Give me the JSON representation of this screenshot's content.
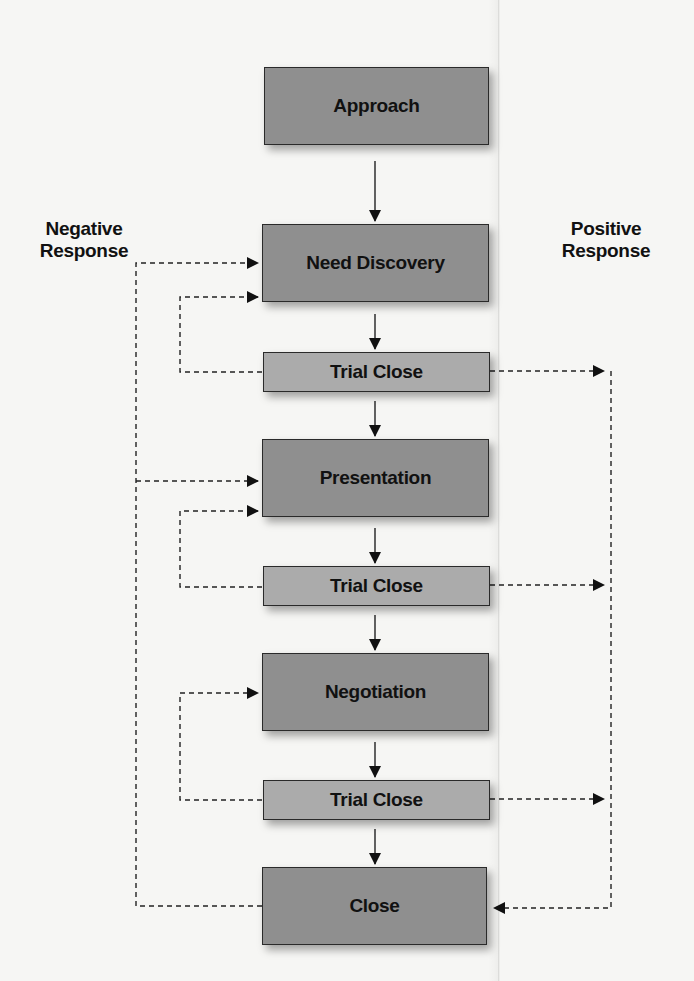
{
  "diagram": {
    "type": "flowchart",
    "labels": {
      "negative": [
        "Negative",
        "Response"
      ],
      "positive": [
        "Positive",
        "Response"
      ]
    },
    "steps": [
      {
        "id": "approach",
        "label": "Approach",
        "kind": "major"
      },
      {
        "id": "need_discovery",
        "label": "Need Discovery",
        "kind": "major"
      },
      {
        "id": "trial_close_1",
        "label": "Trial Close",
        "kind": "trial"
      },
      {
        "id": "presentation",
        "label": "Presentation",
        "kind": "major"
      },
      {
        "id": "trial_close_2",
        "label": "Trial Close",
        "kind": "trial"
      },
      {
        "id": "negotiation",
        "label": "Negotiation",
        "kind": "major"
      },
      {
        "id": "trial_close_3",
        "label": "Trial Close",
        "kind": "trial"
      },
      {
        "id": "close",
        "label": "Close",
        "kind": "major"
      }
    ],
    "main_flow": [
      "approach",
      "need_discovery",
      "trial_close_1",
      "presentation",
      "trial_close_2",
      "negotiation",
      "trial_close_3",
      "close"
    ],
    "negative_response_edges": [
      {
        "from": "close",
        "to": "need_discovery",
        "style": "dashed"
      },
      {
        "from": "close",
        "to": "presentation",
        "style": "dashed"
      },
      {
        "from": "trial_close_1",
        "to": "need_discovery",
        "style": "dashed"
      },
      {
        "from": "trial_close_2",
        "to": "presentation",
        "style": "dashed"
      },
      {
        "from": "trial_close_3",
        "to": "negotiation",
        "style": "dashed"
      }
    ],
    "positive_response_edges": [
      {
        "from": "trial_close_1",
        "to": "close",
        "style": "dashed"
      },
      {
        "from": "trial_close_2",
        "to": "close",
        "style": "dashed"
      },
      {
        "from": "trial_close_3",
        "to": "close",
        "style": "dashed"
      }
    ],
    "colors": {
      "major_box": "#8f8f8f",
      "trial_box": "#ababab",
      "border": "#2a2a2a",
      "text": "#111111",
      "background": "#f6f6f4"
    }
  }
}
